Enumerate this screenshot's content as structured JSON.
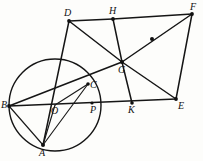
{
  "figure": {
    "canvas": {
      "width": 203,
      "height": 161
    },
    "stroke_color": "#151515",
    "background_color": "#fdfdfb",
    "label_color": "#111111"
  },
  "points": {
    "A": {
      "label": "A",
      "x": 43,
      "y": 145,
      "label_x": 39,
      "label_y": 148
    },
    "B": {
      "label": "B",
      "x": 9,
      "y": 106,
      "label_x": 1,
      "label_y": 100
    },
    "C": {
      "label": "C",
      "x": 88,
      "y": 84,
      "label_x": 90,
      "label_y": 80
    },
    "D": {
      "label": "D",
      "x": 69,
      "y": 21,
      "label_x": 64,
      "label_y": 8
    },
    "E": {
      "label": "E",
      "x": 176,
      "y": 99,
      "label_x": 178,
      "label_y": 101
    },
    "F": {
      "label": "F",
      "x": 192,
      "y": 14,
      "label_x": 190,
      "label_y": 2
    },
    "G": {
      "label": "G",
      "x": 122,
      "y": 62,
      "label_x": 118,
      "label_y": 65
    },
    "H": {
      "label": "H",
      "x": 113,
      "y": 19,
      "label_x": 109,
      "label_y": 6
    },
    "K": {
      "label": "K",
      "x": 132,
      "y": 103,
      "label_x": 128,
      "label_y": 105
    },
    "O": {
      "label": "O",
      "x": 55,
      "y": 105,
      "label_x": 51,
      "label_y": 106
    },
    "P": {
      "label": "P",
      "x": 92,
      "y": 103,
      "label_x": 90,
      "label_y": 105
    }
  },
  "circle": {
    "name": "circumcircle-O",
    "cx": 55,
    "cy": 105,
    "r": 46
  },
  "segments": [
    {
      "name": "segment-D-H",
      "from": "D",
      "to": "H",
      "weight": "thick"
    },
    {
      "name": "segment-H-F",
      "from": "H",
      "to": "F",
      "weight": "thick"
    },
    {
      "name": "segment-F-E",
      "from": "F",
      "to": "E",
      "weight": "thick"
    },
    {
      "name": "segment-B-E",
      "from": "B",
      "to": "E",
      "weight": "thick"
    },
    {
      "name": "segment-D-G",
      "from": "D",
      "to": "G",
      "weight": "thick"
    },
    {
      "name": "segment-G-E",
      "from": "G",
      "to": "E",
      "weight": "thick"
    },
    {
      "name": "segment-B-G",
      "from": "B",
      "to": "G",
      "weight": "thick"
    },
    {
      "name": "segment-G-F",
      "from": "G",
      "to": "F",
      "weight": "thick"
    },
    {
      "name": "segment-H-G",
      "from": "H",
      "to": "G",
      "weight": "thick"
    },
    {
      "name": "segment-G-K",
      "from": "G",
      "to": "K",
      "weight": "thick"
    },
    {
      "name": "segment-D-A",
      "from": "D",
      "to": "A",
      "weight": "thick"
    },
    {
      "name": "segment-B-A",
      "from": "B",
      "to": "A",
      "weight": "thin"
    },
    {
      "name": "segment-A-C",
      "from": "A",
      "to": "C",
      "weight": "thin"
    },
    {
      "name": "segment-O-C",
      "from": "O",
      "to": "C",
      "weight": "thin"
    },
    {
      "name": "segment-O-A",
      "from": "O",
      "to": "A",
      "weight": "thin"
    }
  ],
  "markers": [
    {
      "name": "midpoint-dot-GF",
      "x": 152,
      "y": 39,
      "r": 2.0
    },
    {
      "name": "vertex-dot-D",
      "x": 69,
      "y": 21,
      "r": 1.9
    },
    {
      "name": "vertex-dot-H",
      "x": 113,
      "y": 19,
      "r": 1.9
    },
    {
      "name": "vertex-dot-F",
      "x": 192,
      "y": 14,
      "r": 1.9
    },
    {
      "name": "vertex-dot-E",
      "x": 176,
      "y": 99,
      "r": 1.9
    },
    {
      "name": "vertex-dot-G",
      "x": 122,
      "y": 62,
      "r": 2.0
    },
    {
      "name": "vertex-dot-K",
      "x": 132,
      "y": 103,
      "r": 1.8
    },
    {
      "name": "vertex-dot-B",
      "x": 9,
      "y": 106,
      "r": 1.9
    },
    {
      "name": "vertex-dot-A",
      "x": 43,
      "y": 145,
      "r": 2.0
    },
    {
      "name": "vertex-dot-C",
      "x": 88,
      "y": 84,
      "r": 1.8
    },
    {
      "name": "vertex-dot-P",
      "x": 92,
      "y": 103,
      "r": 1.6
    }
  ]
}
